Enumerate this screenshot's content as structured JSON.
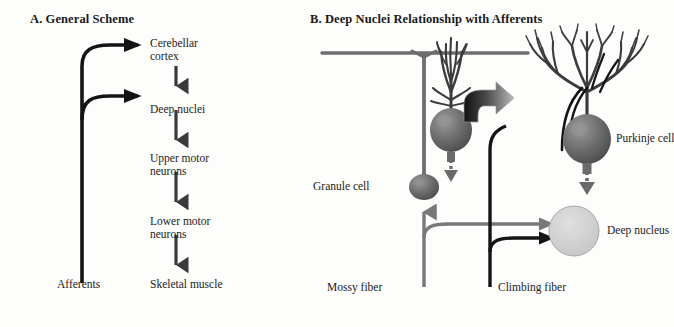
{
  "figure": {
    "background": "#fdfdfc",
    "ink_black": "#141414",
    "ink_gray": "#6e6e6e",
    "cell_gray": "#6a6a6a",
    "nucleus_gray": "#cfcfcf"
  },
  "panel_a": {
    "title": "A. General Scheme",
    "input_label": "Afferents",
    "nodes": [
      {
        "label": "Cerebellar\ncortex"
      },
      {
        "label": "Deep nuclei"
      },
      {
        "label": "Upper motor\nneurons"
      },
      {
        "label": "Lower motor\nneurons"
      },
      {
        "label": "Skeletal muscle"
      }
    ]
  },
  "panel_b": {
    "title": "B. Deep Nuclei Relationship with Afferents",
    "labels": {
      "granule_cell": "Granule cell",
      "purkinje_cell": "Purkinje cell",
      "deep_nucleus": "Deep nucleus",
      "mossy_fiber": "Mossy fiber",
      "climbing_fiber": "Climbing fiber"
    }
  }
}
